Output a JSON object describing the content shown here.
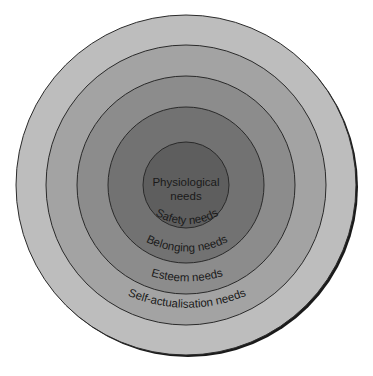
{
  "diagram": {
    "type": "concentric-circles",
    "rings": [
      {
        "label": "Self-actualisation needs",
        "radius": 170,
        "fill": "#bdbdbd"
      },
      {
        "label": "Esteem needs",
        "radius": 140,
        "fill": "#a3a3a3"
      },
      {
        "label": "Belonging needs",
        "radius": 109,
        "fill": "#8c8c8c"
      },
      {
        "label": "Safety needs",
        "radius": 78,
        "fill": "#727272"
      },
      {
        "label_line1": "Physiological",
        "label_line2": "needs",
        "radius": 43,
        "fill": "#5e5e5e"
      }
    ],
    "stroke": "#2a2a2a",
    "shadow": "#1a1a1a"
  }
}
